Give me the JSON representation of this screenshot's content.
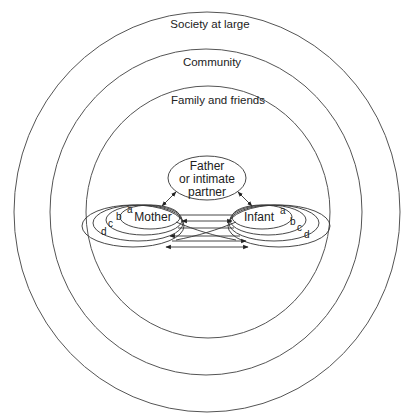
{
  "diagram": {
    "type": "nested-ecological-model",
    "rings": [
      {
        "id": "society",
        "label": "Society at large"
      },
      {
        "id": "community",
        "label": "Community"
      },
      {
        "id": "family",
        "label": "Family and friends"
      }
    ],
    "nodes": {
      "father": {
        "line1": "Father",
        "line2": "or intimate",
        "line3": "partner"
      },
      "mother": {
        "label": "Mother"
      },
      "infant": {
        "label": "Infant"
      }
    },
    "loop_letters": {
      "mother": [
        "a",
        "b",
        "c",
        "d"
      ],
      "infant": [
        "a",
        "b",
        "c",
        "d"
      ]
    },
    "edges": [
      {
        "from": "father",
        "to": "mother",
        "bidirectional": true
      },
      {
        "from": "father",
        "to": "infant",
        "bidirectional": true
      },
      {
        "from": "mother",
        "to": "infant",
        "bidirectional": true,
        "levels": [
          "a",
          "b",
          "c",
          "d"
        ]
      }
    ],
    "colors": {
      "stroke": "#333333",
      "text": "#222222",
      "background": "#ffffff"
    }
  }
}
